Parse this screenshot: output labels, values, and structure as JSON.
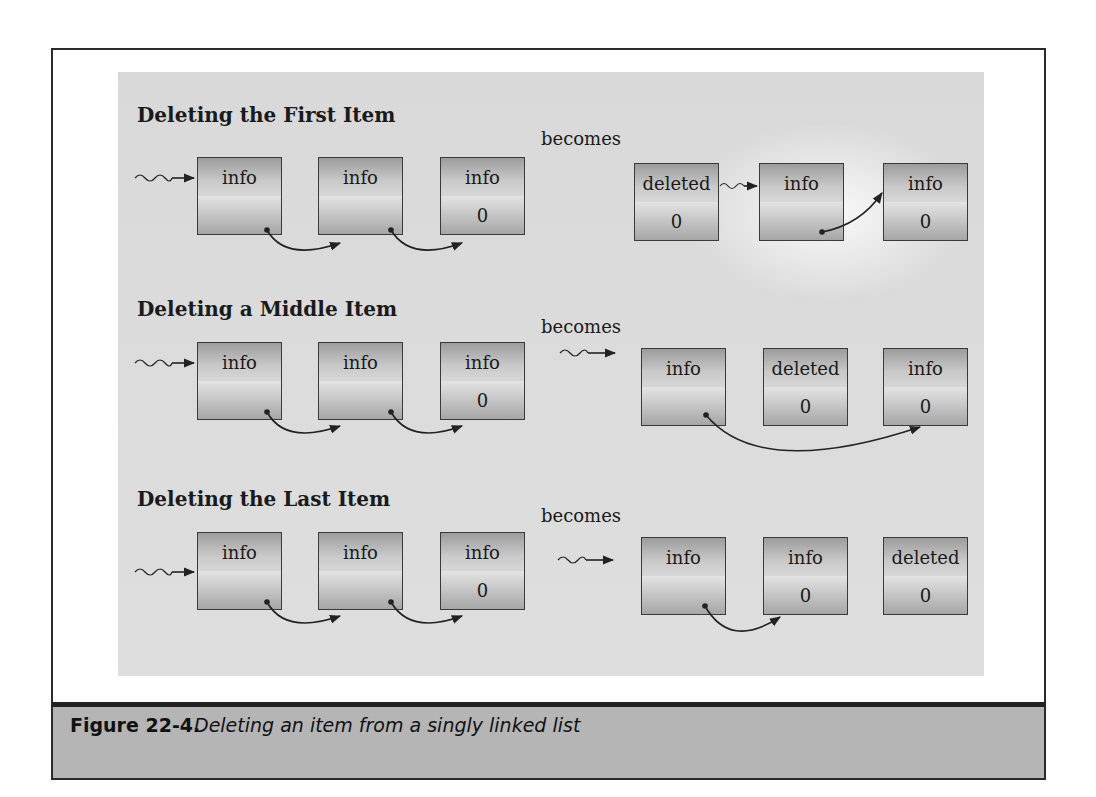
{
  "figure": {
    "label": "Figure 22-4.",
    "caption": "Deleting an item from a singly linked list"
  },
  "sections": [
    {
      "title": "Deleting the First Item",
      "becomes": "becomes",
      "before": [
        {
          "top": "info",
          "bottom": ""
        },
        {
          "top": "info",
          "bottom": ""
        },
        {
          "top": "info",
          "bottom": "0"
        }
      ],
      "after": [
        {
          "top": "deleted",
          "bottom": "0"
        },
        {
          "top": "info",
          "bottom": ""
        },
        {
          "top": "info",
          "bottom": "0"
        }
      ]
    },
    {
      "title": "Deleting a Middle Item",
      "becomes": "becomes",
      "before": [
        {
          "top": "info",
          "bottom": ""
        },
        {
          "top": "info",
          "bottom": ""
        },
        {
          "top": "info",
          "bottom": "0"
        }
      ],
      "after": [
        {
          "top": "info",
          "bottom": ""
        },
        {
          "top": "deleted",
          "bottom": "0"
        },
        {
          "top": "info",
          "bottom": "0"
        }
      ]
    },
    {
      "title": "Deleting the Last Item",
      "becomes": "becomes",
      "before": [
        {
          "top": "info",
          "bottom": ""
        },
        {
          "top": "info",
          "bottom": ""
        },
        {
          "top": "info",
          "bottom": "0"
        }
      ],
      "after": [
        {
          "top": "info",
          "bottom": ""
        },
        {
          "top": "info",
          "bottom": "0"
        },
        {
          "top": "deleted",
          "bottom": "0"
        }
      ]
    }
  ],
  "colors": {
    "panel": "#dcdcdc",
    "caption_bar": "#b5b5b5",
    "frame": "#2b2b2b",
    "arrow": "#222222"
  }
}
